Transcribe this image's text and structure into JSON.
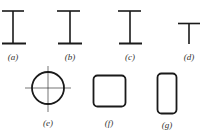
{
  "figure": {
    "stroke_color": "#1a1a1a",
    "shapes": [
      {
        "id": "a",
        "type": "I-section",
        "label": "(a)"
      },
      {
        "id": "b",
        "type": "I-section",
        "label": "(b)"
      },
      {
        "id": "c",
        "type": "I-section",
        "label": "(c)"
      },
      {
        "id": "d",
        "type": "T-section",
        "label": "(d)"
      },
      {
        "id": "e",
        "type": "circle-with-crosshair",
        "label": "(e)"
      },
      {
        "id": "f",
        "type": "rounded-square",
        "label": "(f)"
      },
      {
        "id": "g",
        "type": "rounded-rectangle",
        "label": "(g)"
      }
    ]
  }
}
